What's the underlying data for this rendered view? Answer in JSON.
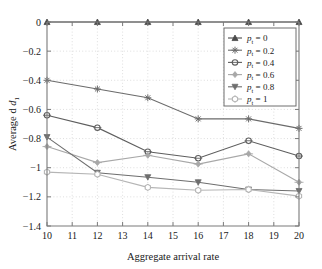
{
  "chart_data": {
    "type": "line",
    "title": "",
    "xlabel": "Aggregate arrival rate",
    "ylabel": "Average d",
    "ylabel_sub": "1",
    "x": [
      10,
      12,
      14,
      16,
      18,
      20
    ],
    "xlim": [
      10,
      20
    ],
    "ylim": [
      -1.4,
      0
    ],
    "xticks": [
      "10",
      "11",
      "12",
      "13",
      "14",
      "15",
      "16",
      "17",
      "18",
      "19",
      "20"
    ],
    "yticks": [
      "0",
      "-0.2",
      "-0.4",
      "-0.6",
      "-0.8",
      "-1",
      "-1.2",
      "-1.4"
    ],
    "grid": true,
    "legend_position": "top-right",
    "series": [
      {
        "name": "p_t = 0",
        "label_main": "p",
        "label_sub": "t",
        "label_rest": " = 0",
        "marker": "triangle-up",
        "color": "#4a4a4a",
        "values": [
          0,
          0,
          0,
          0,
          0,
          0
        ]
      },
      {
        "name": "p_t = 0.2",
        "label_main": "p",
        "label_sub": "t",
        "label_rest": " = 0.2",
        "marker": "star",
        "color": "#6b6b6b",
        "values": [
          -0.4,
          -0.46,
          -0.52,
          -0.665,
          -0.665,
          -0.73
        ]
      },
      {
        "name": "p_t = 0.4",
        "label_main": "p",
        "label_sub": "t",
        "label_rest": " = 0.4",
        "marker": "circle-open",
        "color": "#5e5e5e",
        "values": [
          -0.64,
          -0.725,
          -0.89,
          -0.935,
          -0.815,
          -0.92
        ]
      },
      {
        "name": "p_t = 0.6",
        "label_main": "p",
        "label_sub": "t",
        "label_rest": " = 0.6",
        "marker": "diamond",
        "color": "#a8a8a8",
        "values": [
          -0.855,
          -0.965,
          -0.915,
          -0.975,
          -0.905,
          -1.1
        ]
      },
      {
        "name": "p_t = 0.8",
        "label_main": "p",
        "label_sub": "t",
        "label_rest": " = 0.8",
        "marker": "triangle-down",
        "color": "#6e6e6e",
        "values": [
          -0.79,
          -1.035,
          -1.065,
          -1.1,
          -1.15,
          -1.16
        ]
      },
      {
        "name": "p_t = 1",
        "label_main": "p",
        "label_sub": "t",
        "label_rest": " = 1",
        "marker": "hexagon",
        "color": "#b5b5b5",
        "values": [
          -1.03,
          -1.045,
          -1.135,
          -1.155,
          -1.15,
          -1.195
        ]
      }
    ]
  }
}
